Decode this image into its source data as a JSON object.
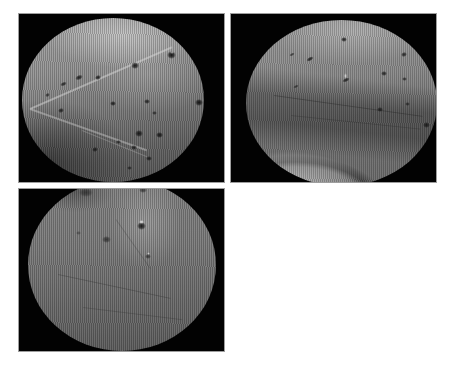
{
  "page": {
    "width": 449,
    "height": 368,
    "background": "#ffffff"
  },
  "collage": {
    "panel_background": "#020202",
    "panel_border_color": "#9e9e9e",
    "tissue_midtone": "#808080",
    "lesion_color": "#101010"
  },
  "panels": [
    {
      "data_name": "endoscopic-frame-top-left",
      "rect": {
        "left": 18,
        "top": 13,
        "width": 207,
        "height": 170
      },
      "scope": {
        "left": 3,
        "top": 4,
        "width": 182,
        "height": 164
      },
      "style_class": "p1",
      "spots": [
        [
          149,
          37,
          9,
          8,
          0,
          0.95
        ],
        [
          113,
          47,
          8,
          7,
          0,
          0.9
        ],
        [
          57,
          59,
          8,
          5,
          -25,
          0.85
        ],
        [
          41,
          66,
          7,
          4,
          -25,
          0.8
        ],
        [
          76,
          59,
          6,
          5,
          -20,
          0.85
        ],
        [
          25,
          77,
          5,
          4,
          -30,
          0.7
        ],
        [
          91,
          85,
          6,
          5,
          0,
          0.85
        ],
        [
          125,
          83,
          6,
          5,
          0,
          0.8
        ],
        [
          177,
          84,
          8,
          7,
          0,
          0.95
        ],
        [
          39,
          92,
          6,
          5,
          -20,
          0.8
        ],
        [
          132,
          95,
          5,
          4,
          0,
          0.7
        ],
        [
          117,
          115,
          8,
          7,
          0,
          0.9
        ],
        [
          137,
          117,
          7,
          6,
          0,
          0.9
        ],
        [
          177,
          115,
          7,
          6,
          0,
          0.85
        ],
        [
          112,
          129,
          6,
          5,
          0,
          0.8
        ],
        [
          167,
          129,
          6,
          5,
          0,
          0.75
        ],
        [
          127,
          140,
          6,
          5,
          0,
          0.8
        ],
        [
          107,
          150,
          5,
          4,
          0,
          0.7
        ],
        [
          73,
          131,
          6,
          5,
          -15,
          0.8
        ],
        [
          96,
          124,
          5,
          4,
          0,
          0.7
        ]
      ],
      "glints": [
        [
          37,
          12,
          12,
          5,
          0.7
        ],
        [
          150,
          34,
          4,
          3,
          0.5
        ]
      ],
      "lines": [
        [
          8,
          90,
          155,
          -23.5,
          2,
          "rgba(225,225,225,0.45)"
        ],
        [
          8,
          90,
          124,
          19.5,
          2,
          "rgba(210,210,210,0.42)"
        ],
        [
          60,
          112,
          70,
          22,
          1,
          "rgba(200,200,200,0.3)"
        ]
      ]
    },
    {
      "data_name": "endoscopic-frame-top-right",
      "rect": {
        "left": 230,
        "top": 13,
        "width": 207,
        "height": 170
      },
      "scope": {
        "left": 15,
        "top": 6,
        "width": 191,
        "height": 166
      },
      "style_class": "p2",
      "spots": [
        [
          98,
          19,
          6,
          5,
          0,
          0.85
        ],
        [
          158,
          34,
          6,
          5,
          -20,
          0.8
        ],
        [
          64,
          39,
          8,
          4,
          -30,
          0.85
        ],
        [
          46,
          34,
          6,
          3,
          -30,
          0.65
        ],
        [
          100,
          60,
          8,
          4,
          -25,
          0.8
        ],
        [
          138,
          53,
          6,
          5,
          0,
          0.8
        ],
        [
          158,
          59,
          5,
          4,
          0,
          0.7
        ],
        [
          195,
          55,
          5,
          4,
          0,
          0.6
        ],
        [
          134,
          89,
          6,
          5,
          0,
          0.75
        ],
        [
          161,
          84,
          5,
          4,
          0,
          0.65
        ],
        [
          50,
          66,
          6,
          3,
          -25,
          0.6
        ],
        [
          180,
          105,
          7,
          6,
          0,
          0.8
        ]
      ],
      "glints": [
        [
          99,
          56,
          3,
          6,
          0.7
        ]
      ],
      "lines": [
        [
          28,
          75,
          150,
          8,
          1,
          "rgba(30,30,30,0.35)"
        ],
        [
          45,
          95,
          130,
          6,
          1,
          "rgba(40,40,40,0.3)"
        ]
      ]
    },
    {
      "data_name": "endoscopic-frame-bottom-left",
      "rect": {
        "left": 18,
        "top": 188,
        "width": 207,
        "height": 164
      },
      "scope": {
        "left": 9,
        "top": -10,
        "width": 188,
        "height": 172
      },
      "style_class": "p3",
      "spots": [
        [
          58,
          13,
          14,
          9,
          0,
          0.5
        ],
        [
          115,
          11,
          8,
          6,
          0,
          0.6
        ],
        [
          113,
          47,
          9,
          8,
          0,
          0.9
        ],
        [
          78,
          60,
          9,
          7,
          0,
          0.6
        ],
        [
          120,
          77,
          6,
          5,
          0,
          0.6
        ],
        [
          50,
          54,
          5,
          4,
          0,
          0.4
        ]
      ],
      "glints": [
        [
          113,
          43,
          5,
          4,
          0.85
        ],
        [
          120,
          74,
          3,
          3,
          0.6
        ]
      ],
      "lines": [
        [
          30,
          95,
          115,
          12,
          1,
          "rgba(35,35,35,0.30)"
        ],
        [
          55,
          128,
          100,
          7,
          1,
          "rgba(35,35,35,0.25)"
        ],
        [
          88,
          40,
          60,
          55,
          1,
          "rgba(45,45,45,0.25)"
        ]
      ]
    }
  ]
}
